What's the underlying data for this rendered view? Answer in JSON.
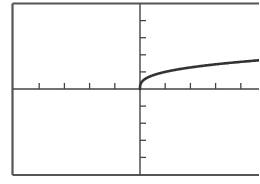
{
  "chart_data": {
    "type": "line",
    "title": "",
    "xlabel": "",
    "ylabel": "",
    "function": "y = cbrt(x), x >= 0",
    "xlim": [
      -5,
      4.76
    ],
    "ylim": [
      -5,
      5
    ],
    "x_ticks": [
      -4,
      -3,
      -2,
      -1,
      1,
      2,
      3,
      4
    ],
    "y_ticks": [
      -4,
      -3,
      -2,
      -1,
      1,
      2,
      3,
      4
    ],
    "tick_labels_shown": false,
    "grid": false,
    "legend": null,
    "series": [
      {
        "name": "curve",
        "x": [
          0,
          0.05,
          0.1,
          0.25,
          0.5,
          1,
          1.5,
          2,
          2.5,
          3,
          3.5,
          4,
          4.5,
          4.76
        ],
        "y": [
          0,
          0.37,
          0.46,
          0.63,
          0.79,
          1.0,
          1.14,
          1.26,
          1.36,
          1.44,
          1.52,
          1.59,
          1.65,
          1.68
        ]
      }
    ]
  },
  "style": {
    "axis_color": "#444444",
    "frame_color": "#555555",
    "curve_color": "#333333",
    "background": "#ffffff"
  }
}
